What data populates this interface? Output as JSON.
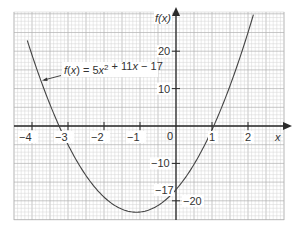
{
  "chart_data": {
    "type": "line",
    "title": "",
    "function_label": "f(x) = 5x² + 11x − 17",
    "function": {
      "a": 5,
      "b": 11,
      "c": -17
    },
    "xlabel": "x",
    "ylabel": "f(x)",
    "xlim": [
      -4.4,
      3.0
    ],
    "ylim": [
      -25.5,
      30
    ],
    "x_ticks": [
      -4,
      -3,
      -2,
      -1,
      0,
      1,
      2
    ],
    "x_tick_labels": [
      "−4",
      "−3",
      "−2",
      "−1",
      "0",
      "1",
      "2"
    ],
    "y_ticks": [
      20,
      10,
      -10,
      -20
    ],
    "y_tick_labels": [
      "20",
      "10",
      "−10",
      "−20"
    ],
    "annotations": [
      {
        "text": "−17",
        "x": 0,
        "y": -17,
        "note": "y-intercept"
      }
    ],
    "grid": true,
    "series": [
      {
        "name": "f(x) = 5x² + 11x − 17",
        "x": [
          -4.13,
          -4,
          -3.5,
          -3.25,
          -3,
          -2.5,
          -2,
          -1.5,
          -1.1,
          -1,
          -0.5,
          0,
          0.5,
          1,
          1.05,
          1.5,
          2,
          2.15
        ],
        "y": [
          23,
          19,
          5.75,
          0,
          -5,
          -13.25,
          -19,
          -22.25,
          -23.05,
          -23,
          -21.25,
          -17,
          -10.25,
          -1,
          0,
          7.75,
          19,
          29.7
        ]
      }
    ],
    "roots": [
      -3.25,
      1.05
    ],
    "vertex": {
      "x": -1.1,
      "y": -23.05
    }
  },
  "colors": {
    "grid_minor": "#d4d4d4",
    "grid_major": "#b0b0b0",
    "axis": "#2a2a2a",
    "curve": "#444444",
    "text": "#333333"
  }
}
